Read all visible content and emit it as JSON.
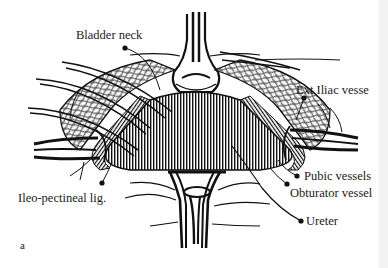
{
  "figure": {
    "panel_letter": "a",
    "labels": {
      "bladder_neck": "Bladder neck",
      "ext_iliac": "Ext Iliac vesse",
      "pubic_vessels": "Pubic vessels",
      "obturator_vessel": "Obturator vessel",
      "ureter": "Ureter",
      "ileo_pectineal": "Ileo-pectineal lig."
    }
  },
  "colors": {
    "ink": "#111111",
    "paper": "#ffffff",
    "edge": "#f3f3f3"
  }
}
